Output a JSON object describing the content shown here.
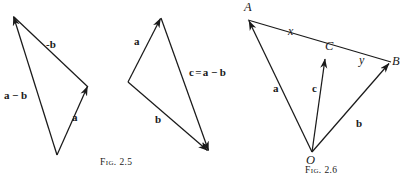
{
  "plate": {
    "name": "vector-subtraction-figures",
    "width": 407,
    "height": 182,
    "background": "#ffffff",
    "ink": "#1a1a1a"
  },
  "figures": [
    {
      "id": "fig-2-5",
      "caption_prefix": "Fig.",
      "caption_number": "2.5",
      "caption_full": "Fig. 2.5",
      "labels": {
        "minus_b": "-b",
        "a_minus_b": "a − b",
        "a": "a"
      }
    },
    {
      "id": "fig-2-6-left",
      "caption_prefix": "Fig.",
      "caption_number": "2.5",
      "labels": {
        "a": "a",
        "b": "b",
        "c_equals": "c = a − b"
      }
    },
    {
      "id": "fig-2-6",
      "caption_prefix": "Fig.",
      "caption_number": "2.6",
      "caption_full": "Fig. 2.6",
      "points": {
        "A": "A",
        "B": "B",
        "C": "C",
        "O": "O"
      },
      "labels": {
        "x": "x",
        "y": "y",
        "a": "a",
        "b": "b",
        "c": "c"
      }
    }
  ]
}
